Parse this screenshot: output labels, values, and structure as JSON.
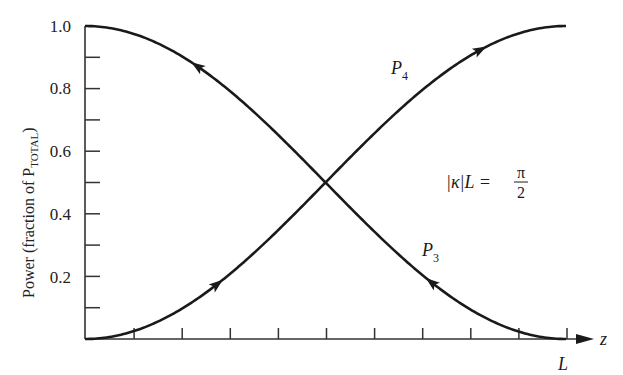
{
  "chart_data": {
    "type": "line",
    "title": "",
    "xlabel": "z",
    "ylabel": "Power (fraction of P_TOTAL)",
    "ylabel_main": "Power (fraction of P",
    "ylabel_sub": "TOTAL",
    "ylabel_close": ")",
    "xlim": [
      0,
      1
    ],
    "ylim": [
      0,
      1.0
    ],
    "x_tick_count": 10,
    "x_end_label": "L",
    "y_ticks": [
      "0.2",
      "0.4",
      "0.6",
      "0.8",
      "1.0"
    ],
    "y_tick_values": [
      0.2,
      0.4,
      0.6,
      0.8,
      1.0
    ],
    "grid": false,
    "annotation": {
      "lhs": "|κ|L = ",
      "numerator": "π",
      "denominator": "2"
    },
    "series": [
      {
        "name": "P4",
        "label_main": "P",
        "label_sub": "4",
        "description": "sin^2(|κ|z), rises from 0 to 1",
        "x": [
          0,
          0.1,
          0.2,
          0.3,
          0.4,
          0.5,
          0.6,
          0.7,
          0.8,
          0.9,
          1.0
        ],
        "values": [
          0.0,
          0.024,
          0.095,
          0.206,
          0.345,
          0.5,
          0.655,
          0.794,
          0.905,
          0.976,
          1.0
        ],
        "arrow_direction": "forward"
      },
      {
        "name": "P3",
        "label_main": "P",
        "label_sub": "3",
        "description": "cos^2(|κ|z), falls from 1 to 0",
        "x": [
          0,
          0.1,
          0.2,
          0.3,
          0.4,
          0.5,
          0.6,
          0.7,
          0.8,
          0.9,
          1.0
        ],
        "values": [
          1.0,
          0.976,
          0.905,
          0.794,
          0.655,
          0.5,
          0.345,
          0.206,
          0.095,
          0.024,
          0.0
        ],
        "arrow_direction": "backward"
      }
    ]
  }
}
